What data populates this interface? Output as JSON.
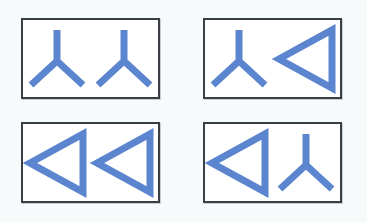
{
  "canvas": {
    "width": 367,
    "height": 222,
    "background_color": "#f7fafb"
  },
  "style": {
    "glyph_color": "#5b85ce",
    "panel_border_color": "#3a3f45",
    "panel_fill_color": "#ffffff",
    "stroke_width": 7
  },
  "glyph_types": {
    "y_shape": "y-shape-glyph",
    "left_triangle": "left-triangle-glyph"
  },
  "panels": [
    {
      "id": "panel-top-left",
      "name": "top-left-panel",
      "position": "top-left",
      "x": 21,
      "y": 18,
      "width": 139,
      "height": 81,
      "glyphs": [
        {
          "name": "glyph-1",
          "type": "y_shape",
          "label": "Y"
        },
        {
          "name": "glyph-2",
          "type": "y_shape",
          "label": "Y"
        }
      ]
    },
    {
      "id": "panel-top-right",
      "name": "top-right-panel",
      "position": "top-right",
      "x": 203,
      "y": 18,
      "width": 139,
      "height": 81,
      "glyphs": [
        {
          "name": "glyph-1",
          "type": "y_shape",
          "label": "Y"
        },
        {
          "name": "glyph-2",
          "type": "left_triangle",
          "label": "Triangle"
        }
      ]
    },
    {
      "id": "panel-bottom-left",
      "name": "bottom-left-panel",
      "position": "bottom-left",
      "x": 21,
      "y": 122,
      "width": 139,
      "height": 81,
      "glyphs": [
        {
          "name": "glyph-1",
          "type": "left_triangle",
          "label": "Triangle"
        },
        {
          "name": "glyph-2",
          "type": "left_triangle",
          "label": "Triangle"
        }
      ]
    },
    {
      "id": "panel-bottom-right",
      "name": "bottom-right-panel",
      "position": "bottom-right",
      "x": 203,
      "y": 122,
      "width": 139,
      "height": 81,
      "glyphs": [
        {
          "name": "glyph-1",
          "type": "left_triangle",
          "label": "Triangle"
        },
        {
          "name": "glyph-2",
          "type": "y_shape",
          "label": "Y"
        }
      ]
    }
  ]
}
